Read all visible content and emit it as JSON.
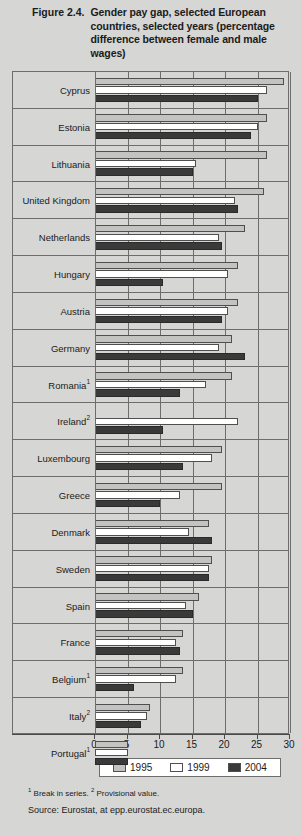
{
  "figure": {
    "number": "Figure 2.4.",
    "title": "Gender pay gap, selected European countries, selected years (percentage difference between female and male wages)"
  },
  "footnotes": {
    "marker1": "1",
    "note1": " Break in series.",
    "marker2": "2",
    "note2": " Provisional value.",
    "source": "Source: Eurostat, at epp.eurostat.ec.europa."
  },
  "legend": {
    "position": "bottom",
    "items": [
      {
        "label": "1995",
        "color": "#c3c3c1"
      },
      {
        "label": "1999",
        "color": "#ffffff"
      },
      {
        "label": "2004",
        "color": "#3a3a3a"
      }
    ]
  },
  "axis": {
    "ticks": [
      0,
      5,
      10,
      15,
      20,
      25,
      30
    ],
    "tick_labels": [
      "0",
      "5",
      "10",
      "15",
      "20",
      "25",
      "30"
    ],
    "min": 0,
    "max": 30
  },
  "chart_data": {
    "type": "bar",
    "orientation": "horizontal",
    "title": "Gender pay gap, selected European countries, selected years (percentage difference between female and male wages)",
    "xlabel": "",
    "ylabel": "",
    "xlim": [
      0,
      30
    ],
    "grid": true,
    "legend_position": "bottom",
    "categories": [
      "Cyprus",
      "Estonia",
      "Lithuania",
      "United Kingdom",
      "Netherlands",
      "Hungary",
      "Austria",
      "Germany",
      "Romania¹",
      "Ireland²",
      "Luxembourg",
      "Greece",
      "Denmark",
      "Sweden",
      "Spain",
      "France",
      "Belgium¹",
      "Italy²",
      "Portugal¹"
    ],
    "series": [
      {
        "name": "1995",
        "color": "#c3c3c1",
        "values": [
          29.0,
          26.5,
          26.5,
          26.0,
          23.0,
          22.0,
          22.0,
          21.0,
          21.0,
          null,
          19.5,
          19.5,
          17.5,
          18.0,
          16.0,
          13.5,
          13.5,
          8.5,
          5.0
        ]
      },
      {
        "name": "1999",
        "color": "#ffffff",
        "values": [
          26.5,
          25.0,
          15.5,
          21.5,
          19.0,
          20.5,
          20.5,
          19.0,
          17.0,
          22.0,
          18.0,
          13.0,
          14.5,
          17.5,
          14.0,
          12.5,
          12.5,
          8.0,
          5.0
        ]
      },
      {
        "name": "2004",
        "color": "#3a3a3a",
        "values": [
          25.0,
          24.0,
          15.0,
          22.0,
          19.5,
          10.5,
          19.5,
          23.0,
          13.0,
          10.5,
          13.5,
          10.0,
          18.0,
          17.5,
          15.0,
          13.0,
          6.0,
          7.0,
          5.0
        ]
      }
    ]
  }
}
